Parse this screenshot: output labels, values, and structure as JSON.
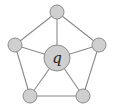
{
  "diagram": {
    "type": "wheel-graph",
    "center": {
      "id": "q",
      "label": "q",
      "x": 57,
      "y": 58,
      "r": 13
    },
    "outer_nodes": [
      {
        "id": "top",
        "label": "",
        "x": 57,
        "y": 12,
        "r": 7
      },
      {
        "id": "right",
        "label": "",
        "x": 99,
        "y": 45,
        "r": 7
      },
      {
        "id": "bottom-right",
        "label": "",
        "x": 83,
        "y": 96,
        "r": 7
      },
      {
        "id": "bottom-left",
        "label": "",
        "x": 30,
        "y": 96,
        "r": 7
      },
      {
        "id": "left",
        "label": "",
        "x": 15,
        "y": 45,
        "r": 7
      }
    ],
    "edges": [
      [
        "q",
        "top"
      ],
      [
        "q",
        "right"
      ],
      [
        "q",
        "bottom-right"
      ],
      [
        "q",
        "bottom-left"
      ],
      [
        "q",
        "left"
      ],
      [
        "top",
        "right"
      ],
      [
        "right",
        "bottom-right"
      ],
      [
        "bottom-right",
        "bottom-left"
      ],
      [
        "bottom-left",
        "left"
      ],
      [
        "left",
        "top"
      ]
    ],
    "colors": {
      "node_fill": "#cfcfcf",
      "node_stroke": "#8c8c8c",
      "edge": "#8a8a8a"
    }
  }
}
